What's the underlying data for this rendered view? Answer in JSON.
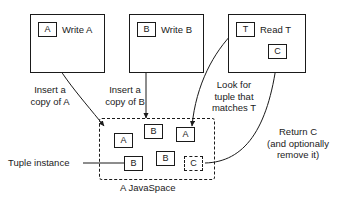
{
  "diagram": {
    "title": "A JavaSpace",
    "caption": "A JavaSpace",
    "tuple_instance_label": "Tuple instance",
    "processes": [
      {
        "id": "write-a",
        "tuple": "A",
        "label": "Write A"
      },
      {
        "id": "write-b",
        "tuple": "B",
        "label": "Write B"
      },
      {
        "id": "read-t",
        "tuple": "T",
        "label": "Read T",
        "result_tuple": "C"
      }
    ],
    "annotations": [
      {
        "id": "insert-a",
        "text": "Insert a\ncopy of A"
      },
      {
        "id": "insert-b",
        "text": "Insert a\ncopy of B"
      },
      {
        "id": "look-for",
        "text": "Look for\ntuple that\nmatches T"
      },
      {
        "id": "return-c",
        "text": "Return C\n(and optionally\nremove it)"
      }
    ],
    "space_tuples": [
      {
        "id": "space-a-1",
        "label": "A",
        "dashed": false
      },
      {
        "id": "space-b-1",
        "label": "B",
        "dashed": false
      },
      {
        "id": "space-a-2",
        "label": "A",
        "dashed": false
      },
      {
        "id": "space-b-2",
        "label": "B",
        "dashed": false
      },
      {
        "id": "space-b-3",
        "label": "B",
        "dashed": false
      },
      {
        "id": "space-c-1",
        "label": "C",
        "dashed": true
      }
    ],
    "colors": {
      "stroke": "#1a1a1a",
      "background": "#ffffff"
    }
  }
}
